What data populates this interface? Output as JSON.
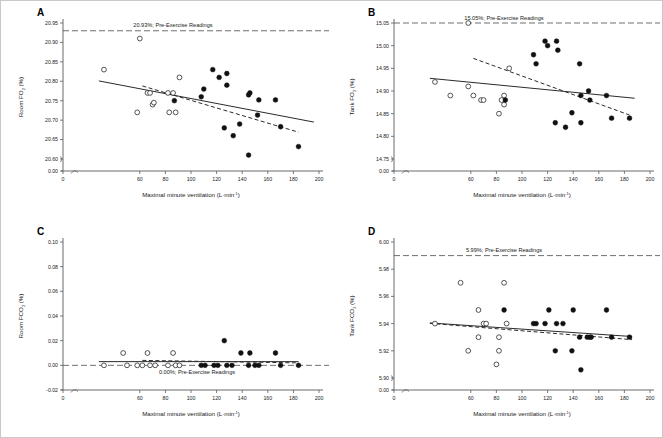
{
  "figure": {
    "name": "four-panel-scatter-regression-figure",
    "panel_count": 4,
    "xlabel": "Maximal minute ventilation (L·min⁻¹)",
    "xlabel_base": "Maximal minute ventilation (L",
    "xlabel_mid": "min",
    "xlabel_sup": "-1",
    "xlabel_end": ")"
  },
  "panels": [
    {
      "letter": "A",
      "ylabel_pre": "Room FO",
      "ylabel_sub": "2",
      "ylabel_post": " (%)",
      "annotation": "20.93%; Pre-Exercise Readings"
    },
    {
      "letter": "B",
      "ylabel_pre": "Tank FO",
      "ylabel_sub": "2",
      "ylabel_post": " (%)",
      "annotation": "15.05%; Pre-Exercise Readings"
    },
    {
      "letter": "C",
      "ylabel_pre": "Room FCO",
      "ylabel_sub": "2",
      "ylabel_post": " (%)",
      "annotation": "0.00%; Pre-Exercise Readings"
    },
    {
      "letter": "D",
      "ylabel_pre": "Tank FCO",
      "ylabel_sub": "2",
      "ylabel_post": " (%)",
      "annotation": "5.99%; Pre-Exercise Readings"
    }
  ],
  "chart_data": [
    {
      "id": "panel-a",
      "type": "scatter",
      "title": "",
      "panel_letter": "A",
      "xlabel": "Maximal minute ventilation (L·min⁻¹)",
      "ylabel": "Room FO2 (%)",
      "xlim": [
        0,
        200
      ],
      "xticks": [
        0,
        60,
        80,
        100,
        120,
        140,
        160,
        180,
        200
      ],
      "xticklabels": [
        "0",
        "60",
        "80",
        "100",
        "120",
        "140",
        "160",
        "180",
        "200"
      ],
      "yticks": [
        20.95,
        20.9,
        20.85,
        20.8,
        20.75,
        20.7,
        20.65,
        20.6,
        0.0
      ],
      "yticklabels": [
        "20.95",
        "20.90",
        "20.85",
        "20.80",
        "20.75",
        "20.70",
        "20.65",
        "20.60",
        "0.00"
      ],
      "ylim": [
        20.575,
        20.96
      ],
      "axis_break": true,
      "grid": false,
      "reference_line": {
        "value": 20.93,
        "label": "20.93%; Pre-Exercise Readings",
        "style": "dashed"
      },
      "series": [
        {
          "name": "open-circles",
          "marker": "open",
          "points": [
            [
              60,
              20.91
            ],
            [
              32,
              20.83
            ],
            [
              58,
              20.72
            ],
            [
              66,
              20.77
            ],
            [
              68,
              20.77
            ],
            [
              70,
              20.74
            ],
            [
              71,
              20.745
            ],
            [
              82,
              20.77
            ],
            [
              86,
              20.77
            ],
            [
              83,
              20.72
            ],
            [
              88,
              20.72
            ],
            [
              91,
              20.81
            ]
          ]
        },
        {
          "name": "closed-circles",
          "marker": "closed",
          "points": [
            [
              87,
              20.75
            ],
            [
              108,
              20.76
            ],
            [
              110,
              20.78
            ],
            [
              117,
              20.83
            ],
            [
              122,
              20.81
            ],
            [
              128,
              20.82
            ],
            [
              128,
              20.79
            ],
            [
              126,
              20.68
            ],
            [
              133,
              20.66
            ],
            [
              138,
              20.69
            ],
            [
              145,
              20.61
            ],
            [
              145,
              20.765
            ],
            [
              146,
              20.77
            ],
            [
              152,
              20.713
            ],
            [
              153,
              20.752
            ],
            [
              166,
              20.752
            ],
            [
              170,
              20.683
            ],
            [
              184,
              20.632
            ]
          ]
        }
      ],
      "trend_lines": [
        {
          "name": "solid-regression",
          "style": "solid",
          "x": [
            28,
            196
          ],
          "y": [
            20.801,
            20.695
          ]
        },
        {
          "name": "dashed-regression",
          "style": "dashed",
          "x": [
            62,
            184
          ],
          "y": [
            20.788,
            20.669
          ]
        }
      ]
    },
    {
      "id": "panel-b",
      "type": "scatter",
      "panel_letter": "B",
      "xlabel": "Maximal minute ventilation (L·min⁻¹)",
      "ylabel": "Tank FO2 (%)",
      "xlim": [
        0,
        200
      ],
      "xticks": [
        0,
        60,
        80,
        100,
        120,
        140,
        160,
        180,
        200
      ],
      "xticklabels": [
        "0",
        "60",
        "80",
        "100",
        "120",
        "140",
        "160",
        "180",
        "200"
      ],
      "yticks": [
        15.05,
        15.0,
        14.95,
        14.9,
        14.85,
        14.8,
        14.75,
        0.0
      ],
      "yticklabels": [
        "15.05",
        "15.00",
        "14.95",
        "14.90",
        "14.85",
        "14.80",
        "14.75",
        "0.00"
      ],
      "ylim": [
        14.735,
        15.06
      ],
      "axis_break": true,
      "grid": false,
      "reference_line": {
        "value": 15.05,
        "label": "15.05%; Pre-Exercise Readings",
        "style": "dashed"
      },
      "series": [
        {
          "name": "open-circles",
          "marker": "open",
          "points": [
            [
              58,
              15.05
            ],
            [
              32,
              14.92
            ],
            [
              44,
              14.89
            ],
            [
              58,
              14.91
            ],
            [
              62,
              14.89
            ],
            [
              68,
              14.88
            ],
            [
              70,
              14.88
            ],
            [
              84,
              14.88
            ],
            [
              86,
              14.89
            ],
            [
              86,
              14.87
            ],
            [
              82,
              14.85
            ],
            [
              90,
              14.95
            ]
          ]
        },
        {
          "name": "closed-circles",
          "marker": "closed",
          "points": [
            [
              87,
              14.88
            ],
            [
              109,
              14.98
            ],
            [
              111,
              14.96
            ],
            [
              118,
              15.01
            ],
            [
              120,
              15.0
            ],
            [
              127,
              15.01
            ],
            [
              128,
              14.99
            ],
            [
              126,
              14.83
            ],
            [
              134,
              14.82
            ],
            [
              139,
              14.852
            ],
            [
              145,
              14.96
            ],
            [
              146,
              14.83
            ],
            [
              146,
              14.89
            ],
            [
              152,
              14.9
            ],
            [
              153,
              14.88
            ],
            [
              166,
              14.89
            ],
            [
              170,
              14.84
            ],
            [
              184,
              14.84
            ]
          ]
        }
      ],
      "trend_lines": [
        {
          "name": "solid-regression",
          "style": "solid",
          "x": [
            28,
            188
          ],
          "y": [
            14.928,
            14.884
          ]
        },
        {
          "name": "dashed-regression",
          "style": "dashed",
          "x": [
            62,
            184
          ],
          "y": [
            14.972,
            14.847
          ]
        }
      ]
    },
    {
      "id": "panel-c",
      "type": "scatter",
      "panel_letter": "C",
      "xlabel": "Maximal minute ventilation (L·min⁻¹)",
      "ylabel": "Room FCO2 (%)",
      "xlim": [
        0,
        200
      ],
      "xticks": [
        0,
        60,
        80,
        100,
        120,
        140,
        160,
        180,
        200
      ],
      "xticklabels": [
        "0",
        "60",
        "80",
        "100",
        "120",
        "140",
        "160",
        "180",
        "200"
      ],
      "yticks": [
        0.1,
        0.08,
        0.06,
        0.04,
        0.02,
        0.0,
        -0.02
      ],
      "yticklabels": [
        "0.10",
        "0.08",
        "0.06",
        "0.04",
        "0.02",
        "0.00",
        "-0.02"
      ],
      "ylim": [
        -0.02,
        0.1
      ],
      "axis_break": true,
      "grid": false,
      "reference_line": {
        "value": 0.0,
        "label": "0.00%; Pre-Exercise Readings",
        "style": "dashed"
      },
      "series": [
        {
          "name": "open-circles",
          "marker": "open",
          "points": [
            [
              32,
              0.0
            ],
            [
              47,
              0.01
            ],
            [
              50,
              0.0
            ],
            [
              58,
              0.0
            ],
            [
              62,
              0.0
            ],
            [
              66,
              0.01
            ],
            [
              68,
              0.0
            ],
            [
              72,
              0.0
            ],
            [
              86,
              0.01
            ],
            [
              82,
              0.0
            ],
            [
              88,
              0.0
            ],
            [
              91,
              0.0
            ]
          ]
        },
        {
          "name": "closed-circles",
          "marker": "closed",
          "points": [
            [
              108,
              0.0
            ],
            [
              111,
              0.0
            ],
            [
              118,
              0.0
            ],
            [
              121,
              0.0
            ],
            [
              126,
              0.02
            ],
            [
              128,
              0.0
            ],
            [
              132,
              0.0
            ],
            [
              139,
              0.01
            ],
            [
              145,
              0.0
            ],
            [
              146,
              0.01
            ],
            [
              150,
              0.0
            ],
            [
              153,
              0.0
            ],
            [
              166,
              0.01
            ],
            [
              170,
              0.0
            ],
            [
              184,
              0.0
            ]
          ]
        }
      ],
      "trend_lines": [
        {
          "name": "solid-regression",
          "style": "solid",
          "x": [
            28,
            184
          ],
          "y": [
            0.003,
            0.003
          ]
        },
        {
          "name": "dashed-regression",
          "style": "dashed",
          "x": [
            62,
            184
          ],
          "y": [
            0.004,
            0.002
          ]
        }
      ]
    },
    {
      "id": "panel-d",
      "type": "scatter",
      "panel_letter": "D",
      "xlabel": "Maximal minute ventilation (L·min⁻¹)",
      "ylabel": "Tank FCO2 (%)",
      "xlim": [
        0,
        200
      ],
      "xticks": [
        0,
        60,
        80,
        100,
        120,
        140,
        160,
        180,
        200
      ],
      "xticklabels": [
        "0",
        "60",
        "80",
        "100",
        "120",
        "140",
        "160",
        "180",
        "200"
      ],
      "yticks": [
        6.0,
        5.98,
        5.96,
        5.94,
        5.92,
        5.9,
        0.0
      ],
      "yticklabels": [
        "6.00",
        "5.98",
        "5.96",
        "5.94",
        "5.92",
        "5.90",
        "0.00"
      ],
      "ylim": [
        5.885,
        6.005
      ],
      "axis_break": true,
      "grid": false,
      "reference_line": {
        "value": 5.99,
        "label": "5.99%; Pre-Exercise Readings",
        "style": "dashed"
      },
      "series": [
        {
          "name": "open-circles",
          "marker": "open",
          "points": [
            [
              32,
              5.94
            ],
            [
              52,
              5.97
            ],
            [
              58,
              5.92
            ],
            [
              66,
              5.95
            ],
            [
              66,
              5.93
            ],
            [
              70,
              5.94
            ],
            [
              72,
              5.94
            ],
            [
              82,
              5.93
            ],
            [
              82,
              5.92
            ],
            [
              80,
              5.91
            ],
            [
              86,
              5.97
            ],
            [
              88,
              5.94
            ]
          ]
        },
        {
          "name": "closed-circles",
          "marker": "closed",
          "points": [
            [
              86,
              5.95
            ],
            [
              109,
              5.94
            ],
            [
              111,
              5.94
            ],
            [
              118,
              5.94
            ],
            [
              121,
              5.95
            ],
            [
              126,
              5.92
            ],
            [
              127,
              5.94
            ],
            [
              132,
              5.94
            ],
            [
              139,
              5.92
            ],
            [
              140,
              5.95
            ],
            [
              145,
              5.93
            ],
            [
              146,
              5.906
            ],
            [
              151,
              5.93
            ],
            [
              153,
              5.93
            ],
            [
              154,
              5.93
            ],
            [
              166,
              5.95
            ],
            [
              170,
              5.93
            ],
            [
              184,
              5.93
            ]
          ]
        }
      ],
      "trend_lines": [
        {
          "name": "solid-regression",
          "style": "solid",
          "x": [
            28,
            186
          ],
          "y": [
            5.9405,
            5.9305
          ]
        },
        {
          "name": "dashed-regression",
          "style": "dashed",
          "x": [
            28,
            186
          ],
          "y": [
            5.9402,
            5.9282
          ]
        }
      ]
    }
  ]
}
